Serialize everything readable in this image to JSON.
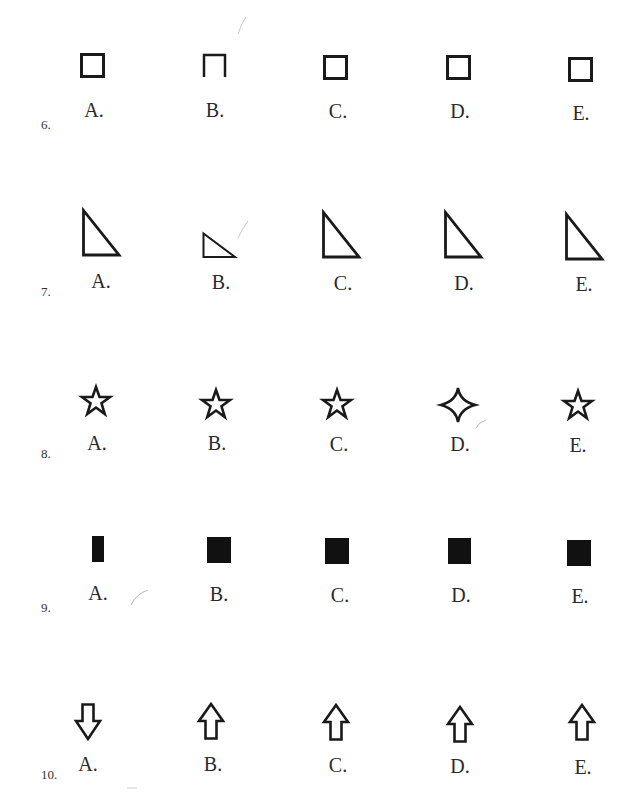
{
  "page": {
    "background": "#ffffff",
    "ink_color": "#1a1a1a"
  },
  "questions": [
    {
      "number": "6.",
      "options": [
        {
          "label": "A.",
          "shape": "square-outline",
          "description": "outlined square"
        },
        {
          "label": "B.",
          "shape": "square-outline-open-bottom",
          "description": "square with bottom side missing"
        },
        {
          "label": "C.",
          "shape": "square-outline",
          "description": "outlined square"
        },
        {
          "label": "D.",
          "shape": "square-outline",
          "description": "outlined square"
        },
        {
          "label": "E.",
          "shape": "square-outline",
          "description": "outlined square"
        }
      ]
    },
    {
      "number": "7.",
      "options": [
        {
          "label": "A.",
          "shape": "right-triangle-outline",
          "description": "right triangle, right angle bottom-left"
        },
        {
          "label": "B.",
          "shape": "right-triangle-outline-small",
          "description": "smaller, flatter right triangle"
        },
        {
          "label": "C.",
          "shape": "right-triangle-outline",
          "description": "right triangle, right angle bottom-left"
        },
        {
          "label": "D.",
          "shape": "right-triangle-outline",
          "description": "right triangle, right angle bottom-left"
        },
        {
          "label": "E.",
          "shape": "right-triangle-outline",
          "description": "right triangle, right angle bottom-left"
        }
      ]
    },
    {
      "number": "8.",
      "options": [
        {
          "label": "A.",
          "shape": "five-point-star-outline",
          "description": "five-pointed star outline"
        },
        {
          "label": "B.",
          "shape": "five-point-star-outline",
          "description": "five-pointed star outline"
        },
        {
          "label": "C.",
          "shape": "five-point-star-outline",
          "description": "five-pointed star outline"
        },
        {
          "label": "D.",
          "shape": "four-point-star-outline",
          "description": "four-pointed star outline"
        },
        {
          "label": "E.",
          "shape": "five-point-star-outline",
          "description": "five-pointed star outline"
        }
      ]
    },
    {
      "number": "9.",
      "options": [
        {
          "label": "A.",
          "shape": "filled-rectangle-narrow",
          "description": "narrow filled black rectangle"
        },
        {
          "label": "B.",
          "shape": "filled-square",
          "description": "filled black square"
        },
        {
          "label": "C.",
          "shape": "filled-square",
          "description": "filled black square"
        },
        {
          "label": "D.",
          "shape": "filled-square",
          "description": "filled black square"
        },
        {
          "label": "E.",
          "shape": "filled-square",
          "description": "filled black square"
        }
      ]
    },
    {
      "number": "10.",
      "options": [
        {
          "label": "A.",
          "shape": "arrow-down-outline",
          "description": "outlined arrow pointing down"
        },
        {
          "label": "B.",
          "shape": "arrow-up-outline",
          "description": "outlined arrow pointing up"
        },
        {
          "label": "C.",
          "shape": "arrow-up-outline",
          "description": "outlined arrow pointing up"
        },
        {
          "label": "D.",
          "shape": "arrow-up-outline",
          "description": "outlined arrow pointing up"
        },
        {
          "label": "E.",
          "shape": "arrow-up-outline",
          "description": "outlined arrow pointing up"
        }
      ]
    }
  ]
}
